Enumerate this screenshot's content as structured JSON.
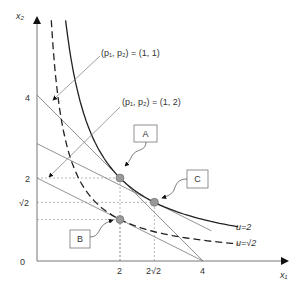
{
  "axes": {
    "x_label": "x₁",
    "y_label": "x₂",
    "origin_label": "0",
    "x_ticks": [
      {
        "value": 2,
        "label": "2"
      },
      {
        "value": 2.8284,
        "label": "2√2"
      },
      {
        "value": 4,
        "label": "4"
      }
    ],
    "y_ticks": [
      {
        "value": 4,
        "label": "4"
      },
      {
        "value": 2,
        "label": "2"
      },
      {
        "value": 1.4142,
        "label": "√2"
      }
    ]
  },
  "budget_lines": [
    {
      "name": "p11",
      "label": "(p₁, p₂) = (1, 1)",
      "p1": 1,
      "p2": 1,
      "income": 4
    },
    {
      "name": "p12",
      "label": "(p₁, p₂) = (1, 2)",
      "p1": 1,
      "p2": 2,
      "income": 4
    },
    {
      "name": "p12-comp",
      "p1": 1,
      "p2": 2,
      "income": 5.6569
    }
  ],
  "indifference_curves": [
    {
      "name": "u2",
      "label": "u=2",
      "product": 4,
      "style": "solid"
    },
    {
      "name": "usqrt2",
      "label": "u=√2",
      "product": 2,
      "style": "dashed"
    }
  ],
  "points": [
    {
      "name": "A",
      "label": "A",
      "x1": 2,
      "x2": 2
    },
    {
      "name": "B",
      "label": "B",
      "x1": 2,
      "x2": 1
    },
    {
      "name": "C",
      "label": "C",
      "x1": 2.8284,
      "x2": 1.4142
    }
  ],
  "colors": {
    "axis": "#666666",
    "curve": "#222222",
    "line": "#777777",
    "point": "#999999",
    "guide": "#888888"
  }
}
